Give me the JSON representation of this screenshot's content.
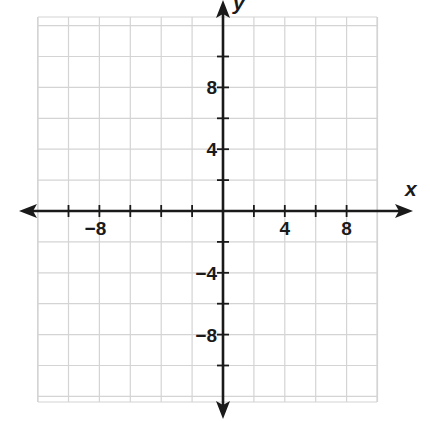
{
  "chart_data": {
    "type": "scatter",
    "title": "",
    "xlabel": "x",
    "ylabel": "y",
    "xlim": [
      -12,
      10
    ],
    "ylim": [
      -12,
      12
    ],
    "grid": true,
    "grid_step": 2,
    "x_tick_labels": [
      {
        "value": -8,
        "text": "−8"
      },
      {
        "value": 4,
        "text": "4"
      },
      {
        "value": 8,
        "text": "8"
      }
    ],
    "y_tick_labels": [
      {
        "value": 8,
        "text": "8"
      },
      {
        "value": 4,
        "text": "4"
      },
      {
        "value": -4,
        "text": "−4"
      },
      {
        "value": -8,
        "text": "−8"
      }
    ],
    "series": [],
    "legend": null
  },
  "colors": {
    "grid": "#d4d4d4",
    "axis": "#1a1a1a",
    "background": "#ffffff"
  }
}
